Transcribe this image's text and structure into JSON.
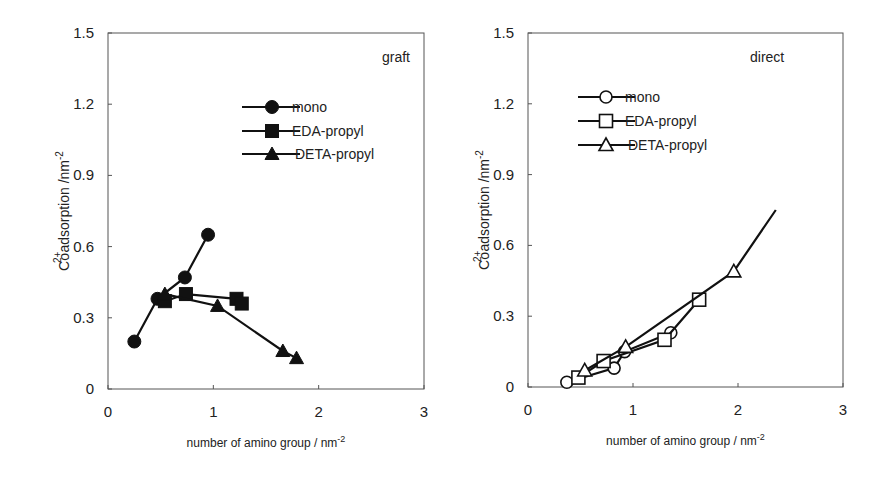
{
  "figure": {
    "panels": [
      {
        "tag": "graft"
      },
      {
        "tag": "direct"
      }
    ],
    "xlabel": "number of amino group / nm",
    "xlabel_sup": "-2",
    "ylabel_prefix": "Co",
    "ylabel_sup": "2+",
    "ylabel_rest": "adsorption /nm",
    "ylabel_unit_sup": "-2",
    "x_ticks": [
      "0",
      "1",
      "2",
      "3"
    ],
    "y_ticks": [
      "0",
      "0.3",
      "0.6",
      "0.9",
      "1.2",
      "1.5"
    ]
  },
  "chart_data": [
    {
      "type": "line",
      "title": "graft",
      "xlabel": "number of amino group / nm^-2",
      "ylabel": "Co2+ adsorption /nm^-2",
      "xlim": [
        0,
        3
      ],
      "ylim": [
        0,
        1.5
      ],
      "x_ticks": [
        0,
        1,
        2,
        3
      ],
      "y_ticks": [
        0,
        0.3,
        0.6,
        0.9,
        1.2,
        1.5
      ],
      "grid": false,
      "legend_position": "upper right",
      "marker_fill": "filled",
      "series": [
        {
          "name": "mono",
          "marker": "circle",
          "x": [
            0.25,
            0.47,
            0.73,
            0.95
          ],
          "y": [
            0.2,
            0.38,
            0.47,
            0.65
          ]
        },
        {
          "name": "EDA-propyl",
          "marker": "square",
          "x": [
            0.54,
            0.74,
            1.22,
            1.27
          ],
          "y": [
            0.37,
            0.4,
            0.38,
            0.36
          ]
        },
        {
          "name": "DETA-propyl",
          "marker": "triangle",
          "x": [
            0.54,
            1.04,
            1.66,
            1.79
          ],
          "y": [
            0.4,
            0.35,
            0.16,
            0.13
          ]
        }
      ]
    },
    {
      "type": "line",
      "title": "direct",
      "xlabel": "number of amino group / nm^-2",
      "ylabel": "Co2+ adsorption /nm^-2",
      "xlim": [
        0,
        3
      ],
      "ylim": [
        0,
        1.5
      ],
      "x_ticks": [
        0,
        1,
        2,
        3
      ],
      "y_ticks": [
        0,
        0.3,
        0.6,
        0.9,
        1.2,
        1.5
      ],
      "grid": false,
      "legend_position": "upper left",
      "marker_fill": "open",
      "series": [
        {
          "name": "mono",
          "marker": "circle",
          "x": [
            0.37,
            0.82,
            0.92,
            1.36
          ],
          "y": [
            0.02,
            0.08,
            0.15,
            0.23
          ]
        },
        {
          "name": "EDA-propyl",
          "marker": "square",
          "x": [
            0.48,
            0.72,
            1.3,
            1.63
          ],
          "y": [
            0.04,
            0.11,
            0.2,
            0.37
          ]
        },
        {
          "name": "DETA-propyl",
          "marker": "triangle",
          "x": [
            0.54,
            0.93,
            1.96,
            2.36
          ],
          "y": [
            0.07,
            0.17,
            0.49,
            0.75
          ],
          "last_point_no_marker": true
        }
      ]
    }
  ]
}
